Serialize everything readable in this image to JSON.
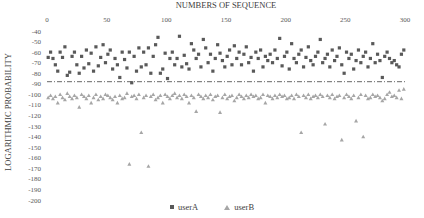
{
  "chart_data": {
    "type": "scatter",
    "title": "",
    "xlabel": "NUMBERS OF SEQUENCE",
    "ylabel": "LOGARITHMIC PROBABILITY",
    "xlim": [
      0,
      300
    ],
    "ylim": [
      -200,
      -40
    ],
    "x_axis_position": "top",
    "x_ticks": [
      0,
      50,
      100,
      150,
      200,
      250,
      300
    ],
    "y_ticks": [
      -40,
      -50,
      -60,
      -70,
      -80,
      -90,
      -100,
      -110,
      -120,
      -130,
      -140,
      -150,
      -160,
      -170,
      -180,
      -190,
      -200
    ],
    "grid": false,
    "legend_position": "bottom",
    "threshold_line": {
      "y": -88,
      "style": "dash-dot",
      "color": "#404040"
    },
    "series": [
      {
        "name": "userA",
        "marker": "square",
        "color": "#595959",
        "x": [
          1,
          3,
          5,
          7,
          9,
          11,
          13,
          15,
          17,
          19,
          21,
          23,
          25,
          27,
          29,
          31,
          33,
          35,
          37,
          39,
          41,
          43,
          45,
          47,
          49,
          51,
          53,
          55,
          57,
          59,
          61,
          63,
          65,
          67,
          69,
          71,
          73,
          75,
          77,
          79,
          81,
          83,
          85,
          87,
          89,
          91,
          93,
          95,
          97,
          99,
          101,
          103,
          105,
          107,
          109,
          111,
          113,
          115,
          117,
          119,
          121,
          123,
          125,
          127,
          129,
          131,
          133,
          135,
          137,
          139,
          141,
          143,
          145,
          147,
          149,
          151,
          153,
          155,
          157,
          159,
          161,
          163,
          165,
          167,
          169,
          171,
          173,
          175,
          177,
          179,
          181,
          183,
          185,
          187,
          189,
          191,
          193,
          195,
          197,
          199,
          201,
          203,
          205,
          207,
          209,
          211,
          213,
          215,
          217,
          219,
          221,
          223,
          225,
          227,
          229,
          231,
          233,
          235,
          237,
          239,
          241,
          243,
          245,
          247,
          249,
          251,
          253,
          255,
          257,
          259,
          261,
          263,
          265,
          267,
          269,
          271,
          273,
          275,
          277,
          279,
          281,
          283,
          285,
          287,
          289,
          291,
          293,
          295,
          297,
          299
        ],
        "y": [
          -65,
          -60,
          -66,
          -72,
          -78,
          -60,
          -65,
          -55,
          -82,
          -79,
          -64,
          -60,
          -72,
          -80,
          -64,
          -75,
          -58,
          -71,
          -61,
          -78,
          -55,
          -73,
          -65,
          -53,
          -70,
          -62,
          -58,
          -76,
          -66,
          -72,
          -84,
          -60,
          -67,
          -75,
          -60,
          -89,
          -64,
          -78,
          -56,
          -74,
          -60,
          -72,
          -56,
          -80,
          -64,
          -53,
          -46,
          -80,
          -76,
          -61,
          -85,
          -66,
          -60,
          -72,
          -66,
          -45,
          -74,
          -63,
          -71,
          -76,
          -52,
          -58,
          -66,
          -62,
          -74,
          -48,
          -56,
          -70,
          -62,
          -78,
          -66,
          -53,
          -61,
          -68,
          -74,
          -64,
          -58,
          -72,
          -54,
          -66,
          -60,
          -72,
          -62,
          -55,
          -70,
          -65,
          -78,
          -60,
          -66,
          -58,
          -74,
          -64,
          -68,
          -62,
          -70,
          -58,
          -66,
          -47,
          -73,
          -64,
          -60,
          -76,
          -52,
          -66,
          -70,
          -62,
          -58,
          -74,
          -65,
          -55,
          -68,
          -72,
          -64,
          -60,
          -48,
          -70,
          -66,
          -62,
          -74,
          -58,
          -68,
          -64,
          -56,
          -72,
          -80,
          -60,
          -66,
          -62,
          -76,
          -68,
          -58,
          -70,
          -64,
          -60,
          -74,
          -66,
          -52,
          -70,
          -62,
          -68,
          -84,
          -64,
          -60,
          -66,
          -70,
          -68,
          -72,
          -74,
          -62,
          -58
        ],
        "value_range": [
          -90,
          -45
        ]
      },
      {
        "name": "userB",
        "marker": "triangle",
        "color": "#a6a6a6",
        "x": [
          1,
          3,
          5,
          7,
          9,
          11,
          13,
          15,
          17,
          19,
          21,
          23,
          25,
          27,
          29,
          31,
          33,
          35,
          37,
          39,
          41,
          43,
          45,
          47,
          49,
          51,
          53,
          55,
          57,
          59,
          61,
          63,
          65,
          67,
          69,
          71,
          73,
          75,
          77,
          79,
          81,
          83,
          85,
          87,
          89,
          91,
          93,
          95,
          97,
          99,
          101,
          103,
          105,
          107,
          109,
          111,
          113,
          115,
          117,
          119,
          121,
          123,
          125,
          127,
          129,
          131,
          133,
          135,
          137,
          139,
          141,
          143,
          145,
          147,
          149,
          151,
          153,
          155,
          157,
          159,
          161,
          163,
          165,
          167,
          169,
          171,
          173,
          175,
          177,
          179,
          181,
          183,
          185,
          187,
          189,
          191,
          193,
          195,
          197,
          199,
          201,
          203,
          205,
          207,
          209,
          211,
          213,
          215,
          217,
          219,
          221,
          223,
          225,
          227,
          229,
          231,
          233,
          235,
          237,
          239,
          241,
          243,
          245,
          247,
          249,
          251,
          253,
          255,
          257,
          259,
          261,
          263,
          265,
          267,
          269,
          271,
          273,
          275,
          277,
          279,
          281,
          283,
          285,
          287,
          289,
          291,
          293,
          295,
          297,
          299
        ],
        "y": [
          -103,
          -101,
          -104,
          -102,
          -108,
          -100,
          -103,
          -105,
          -99,
          -102,
          -104,
          -101,
          -103,
          -112,
          -100,
          -102,
          -104,
          -101,
          -108,
          -103,
          -100,
          -105,
          -102,
          -104,
          -100,
          -101,
          -103,
          -105,
          -102,
          -108,
          -101,
          -104,
          -103,
          -99,
          -166,
          -102,
          -101,
          -104,
          -100,
          -136,
          -103,
          -101,
          -168,
          -102,
          -100,
          -105,
          -103,
          -101,
          -108,
          -100,
          -102,
          -104,
          -101,
          -99,
          -103,
          -101,
          -104,
          -100,
          -102,
          -108,
          -101,
          -103,
          -116,
          -100,
          -102,
          -104,
          -101,
          -103,
          -100,
          -105,
          -102,
          -101,
          -117,
          -103,
          -100,
          -104,
          -102,
          -101,
          -106,
          -103,
          -100,
          -102,
          -104,
          -101,
          -103,
          -100,
          -102,
          -101,
          -104,
          -103,
          -100,
          -108,
          -101,
          -102,
          -104,
          -101,
          -103,
          -100,
          -102,
          -101,
          -104,
          -103,
          -101,
          -104,
          -100,
          -102,
          -136,
          -101,
          -103,
          -100,
          -104,
          -102,
          -101,
          -103,
          -100,
          -102,
          -128,
          -101,
          -103,
          -100,
          -104,
          -102,
          -101,
          -143,
          -103,
          -100,
          -102,
          -104,
          -101,
          -125,
          -103,
          -100,
          -140,
          -101,
          -104,
          -103,
          -100,
          -102,
          -101,
          -103,
          -106,
          -104,
          -100,
          -98,
          -102,
          -101,
          -103,
          -96,
          -104,
          -95
        ],
        "value_range": [
          -170,
          -95
        ]
      }
    ]
  },
  "legend": {
    "items": [
      {
        "label": "userA",
        "marker": "square"
      },
      {
        "label": "userB",
        "marker": "triangle"
      }
    ]
  }
}
